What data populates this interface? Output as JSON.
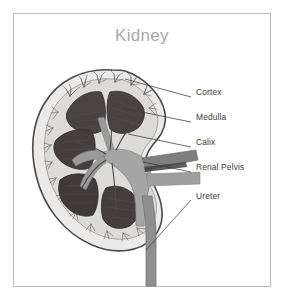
{
  "figure": {
    "title": "Kidney",
    "title_color": "#a9a9a9",
    "frame_color": "#b9b9b9",
    "background": "#ffffff"
  },
  "palette": {
    "capsule_outline": "#4a4a4a",
    "cortex_fill": "#e2e0de",
    "cortex_inner": "#d2cfcc",
    "medulla_fill": "#4a4444",
    "medulla_dark": "#3a3434",
    "pelvis_fill": "#9a9a9a",
    "vessel_gray": "#8a8a8a",
    "ureter_fill": "#8a8a8a",
    "leader_line": "#3b3b3b",
    "label_text": "#3b3b3b"
  },
  "labels": [
    {
      "id": "cortex",
      "text": "Cortex",
      "x": 196,
      "y": 92,
      "leader": {
        "x1": 125,
        "y1": 79,
        "x2": 191,
        "y2": 97
      }
    },
    {
      "id": "medulla",
      "text": "Medulla",
      "x": 196,
      "y": 117,
      "leader": {
        "x1": 122,
        "y1": 108,
        "x2": 191,
        "y2": 122
      }
    },
    {
      "id": "calix",
      "text": "Calix",
      "x": 196,
      "y": 142,
      "leader": {
        "x1": 128,
        "y1": 134,
        "x2": 191,
        "y2": 147
      }
    },
    {
      "id": "renal-pelvis",
      "text": "Renal Pelvis",
      "x": 196,
      "y": 167,
      "leader": {
        "x1": 143,
        "y1": 162,
        "x2": 191,
        "y2": 172
      }
    },
    {
      "id": "ureter",
      "text": "Ureter",
      "x": 196,
      "y": 196,
      "leader": {
        "x1": 146,
        "y1": 250,
        "x2": 191,
        "y2": 200
      }
    }
  ],
  "anatomy": {
    "parts": [
      "renal-capsule",
      "renal-cortex",
      "renal-medulla-pyramids",
      "minor-calix",
      "renal-pelvis",
      "renal-artery",
      "renal-vein",
      "ureter"
    ]
  }
}
